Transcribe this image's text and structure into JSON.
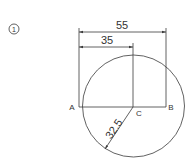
{
  "figure": {
    "problem_number": "1",
    "dimensions": {
      "overall_width": "55",
      "partial_width": "35",
      "radius": "32.5"
    },
    "points": {
      "a": "A",
      "b": "B",
      "c": "C"
    },
    "colors": {
      "stroke": "#3a3a3a",
      "text": "#333333",
      "background": "#ffffff"
    }
  }
}
